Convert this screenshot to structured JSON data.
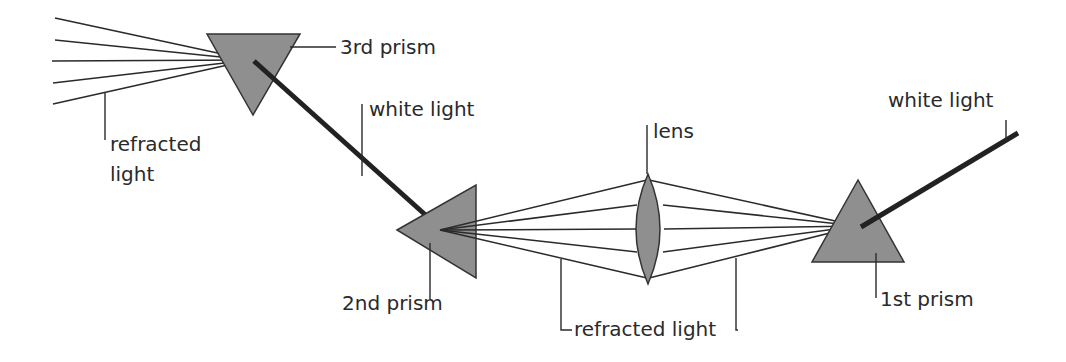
{
  "diagram": {
    "labels": {
      "third_prism": "3rd prism",
      "white_light_middle": "white light",
      "refracted_light_left_line1": "refracted",
      "refracted_light_left_line2": "light",
      "lens": "lens",
      "white_light_right": "white light",
      "second_prism": "2nd prism",
      "refracted_light_bottom": "refracted light",
      "first_prism": "1st prism"
    },
    "colors": {
      "prism_fill": "#8f8f8f",
      "line": "#2a2a2a",
      "background": "#ffffff"
    }
  }
}
